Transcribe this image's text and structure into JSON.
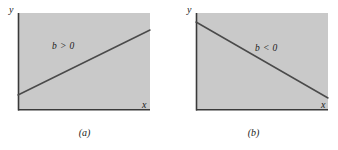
{
  "figure": {
    "colors": {
      "panel_fill": "#c9c9c9",
      "axis_line": "#3a3a3a",
      "data_line": "#4a4a4a",
      "text": "#1a1a1a",
      "background": "#ffffff"
    },
    "panels": [
      {
        "id": "a",
        "caption": "(a)",
        "annotation": "b > 0",
        "axis_y_label": "y",
        "axis_x_label": "x",
        "slope_sign": "positive",
        "line": {
          "x1": 0,
          "y1": 82,
          "x2": 132,
          "y2": 17
        },
        "frame": {
          "left": 18,
          "top": 13,
          "width": 132,
          "height": 97
        }
      },
      {
        "id": "b",
        "caption": "(b)",
        "annotation": "b < 0",
        "axis_y_label": "y",
        "axis_x_label": "x",
        "slope_sign": "negative",
        "line": {
          "x1": 0,
          "y1": 9,
          "x2": 132,
          "y2": 85
        },
        "frame": {
          "left": 27,
          "top": 13,
          "width": 132,
          "height": 97
        }
      }
    ]
  }
}
